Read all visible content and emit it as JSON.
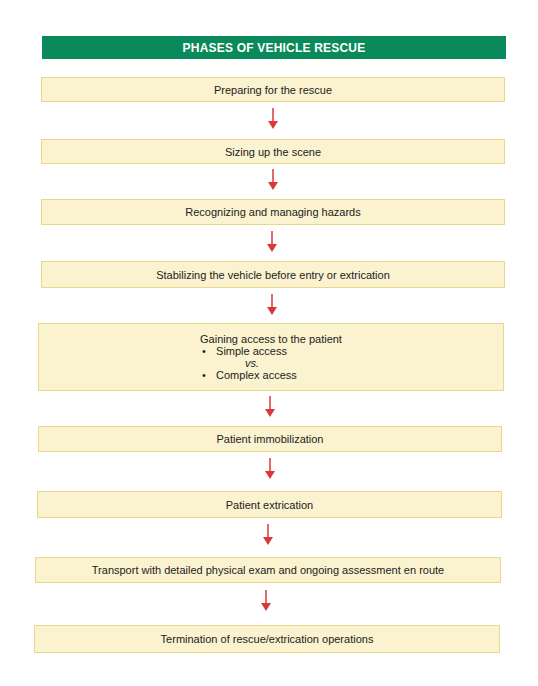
{
  "title": "PHASES OF VEHICLE RESCUE",
  "colors": {
    "header_bg": "#0a8a5a",
    "box_bg": "#fbf3cf",
    "box_border": "#e8d98a",
    "arrow": "#d9393b"
  },
  "steps": [
    {
      "label": "Preparing for the rescue"
    },
    {
      "label": "Sizing up the scene"
    },
    {
      "label": "Recognizing and managing hazards"
    },
    {
      "label": "Stabilizing the vehicle before entry or extrication"
    },
    {
      "label": "Gaining access to the patient",
      "bullets": [
        "Simple access",
        "Complex access"
      ],
      "separator": "vs."
    },
    {
      "label": "Patient immobilization"
    },
    {
      "label": "Patient extrication"
    },
    {
      "label": "Transport with detailed physical exam and ongoing assessment en route"
    },
    {
      "label": "Termination of rescue/extrication operations"
    }
  ],
  "arrow_icon": "arrow-down-icon"
}
